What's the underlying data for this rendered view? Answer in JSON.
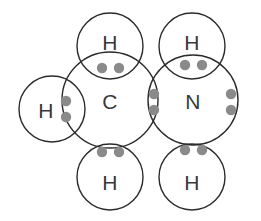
{
  "diagram": {
    "molecule_formula": "CH3NH2",
    "background_color": "#ffffff",
    "circle_stroke_color": "#2b2b2b",
    "label_color": "#3a3a3a",
    "electron_color": "#8a8a8a",
    "atoms": [
      {
        "id": "carbon",
        "label": "C",
        "element": "C",
        "cx": 110,
        "cy": 100,
        "r": 48,
        "label_x": 110,
        "label_y": 101,
        "role": "central-atom"
      },
      {
        "id": "nitrogen",
        "label": "N",
        "element": "N",
        "cx": 193,
        "cy": 100,
        "r": 45,
        "label_x": 193,
        "label_y": 101,
        "role": "central-atom"
      },
      {
        "id": "hydrogen-left",
        "label": "H",
        "element": "H",
        "cx": 52,
        "cy": 109,
        "r": 33,
        "label_x": 46,
        "label_y": 110,
        "role": "terminal-atom"
      },
      {
        "id": "hydrogen-top-left",
        "label": "H",
        "element": "H",
        "cx": 110,
        "cy": 46,
        "r": 33,
        "label_x": 110,
        "label_y": 42,
        "role": "terminal-atom"
      },
      {
        "id": "hydrogen-bottom-left",
        "label": "H",
        "element": "H",
        "cx": 110,
        "cy": 177,
        "r": 33,
        "label_x": 110,
        "label_y": 182,
        "role": "terminal-atom"
      },
      {
        "id": "hydrogen-top-right",
        "label": "H",
        "element": "H",
        "cx": 192,
        "cy": 46,
        "r": 33,
        "label_x": 192,
        "label_y": 42,
        "role": "terminal-atom"
      },
      {
        "id": "hydrogen-bottom-right",
        "label": "H",
        "element": "H",
        "cx": 192,
        "cy": 177,
        "r": 33,
        "label_x": 192,
        "label_y": 182,
        "role": "terminal-atom"
      }
    ],
    "electron_pairs": [
      {
        "id": "bond-pair-c-h-left",
        "type": "bonding",
        "between": "C-H",
        "orientation": "vertical",
        "dots": [
          {
            "cx": 66,
            "cy": 101,
            "r": 5.2
          },
          {
            "cx": 66,
            "cy": 117,
            "r": 5.2
          }
        ]
      },
      {
        "id": "bond-pair-c-h-top",
        "type": "bonding",
        "between": "C-H",
        "orientation": "horizontal",
        "dots": [
          {
            "cx": 102,
            "cy": 68,
            "r": 5.2
          },
          {
            "cx": 119,
            "cy": 68,
            "r": 5.2
          }
        ]
      },
      {
        "id": "bond-pair-c-h-bottom",
        "type": "bonding",
        "between": "C-H",
        "orientation": "horizontal",
        "dots": [
          {
            "cx": 102,
            "cy": 152,
            "r": 5.2
          },
          {
            "cx": 119,
            "cy": 152,
            "r": 5.2
          }
        ]
      },
      {
        "id": "bond-pair-c-n",
        "type": "bonding",
        "between": "C-N",
        "orientation": "vertical",
        "dots": [
          {
            "cx": 154,
            "cy": 94,
            "r": 5.2
          },
          {
            "cx": 154,
            "cy": 110,
            "r": 5.2
          }
        ]
      },
      {
        "id": "bond-pair-n-h-top",
        "type": "bonding",
        "between": "N-H",
        "orientation": "horizontal",
        "dots": [
          {
            "cx": 185,
            "cy": 65,
            "r": 5.2
          },
          {
            "cx": 202,
            "cy": 65,
            "r": 5.2
          }
        ]
      },
      {
        "id": "bond-pair-n-h-bottom",
        "type": "bonding",
        "between": "N-H",
        "orientation": "horizontal",
        "dots": [
          {
            "cx": 185,
            "cy": 150,
            "r": 5.2
          },
          {
            "cx": 202,
            "cy": 150,
            "r": 5.2
          }
        ]
      },
      {
        "id": "lone-pair-nitrogen",
        "type": "lone-pair",
        "between": "N",
        "orientation": "vertical",
        "dots": [
          {
            "cx": 231,
            "cy": 94,
            "r": 5.2
          },
          {
            "cx": 231,
            "cy": 110,
            "r": 5.2
          }
        ]
      }
    ]
  }
}
